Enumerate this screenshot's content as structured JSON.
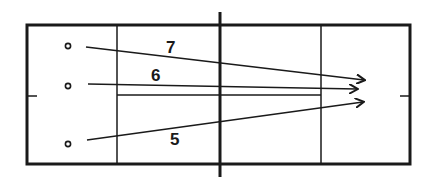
{
  "diagram": {
    "type": "court-shot-diagram",
    "line_color": "#1a1a1a",
    "background": "#ffffff",
    "players": [
      {
        "id": "p7",
        "label": "7"
      },
      {
        "id": "p6",
        "label": "6"
      },
      {
        "id": "p5",
        "label": "5"
      }
    ],
    "shots": [
      {
        "from": "p7",
        "label": "7"
      },
      {
        "from": "p6",
        "label": "6"
      },
      {
        "from": "p5",
        "label": "5"
      }
    ]
  }
}
